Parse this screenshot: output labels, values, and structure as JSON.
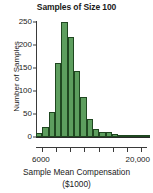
{
  "chart_data": {
    "type": "bar",
    "title": "Samples of Size 100",
    "xlabel": "Sample Mean Compensation",
    "xlabel_unit": "($1000)",
    "ylabel": "Number of Samples",
    "ylim": [
      0,
      250
    ],
    "yticks": [
      0,
      50,
      100,
      150,
      200,
      250
    ],
    "ytick_labels": [
      "0",
      "50",
      "100",
      "150",
      "200",
      "250"
    ],
    "xlim": [
      5000,
      21000
    ],
    "xtick_labels_shown": [
      "6000",
      "20,000"
    ],
    "xtick_count": 8,
    "grid": false,
    "legend": false,
    "bar_color": "#5d9e5e",
    "bar_edge_color": "#1f4720",
    "bin_width": 800,
    "categories": [
      "6000",
      "6800",
      "7600",
      "8400",
      "9200",
      "10000",
      "10800",
      "11600",
      "12400",
      "13200",
      "14000",
      "14800",
      "15600",
      "16400",
      "17200",
      "18000",
      "18800",
      "19600"
    ],
    "values": [
      8,
      22,
      55,
      160,
      250,
      217,
      143,
      88,
      40,
      18,
      11,
      11,
      6,
      2,
      1,
      1,
      0,
      1
    ]
  },
  "axes": {
    "ytick_marks": [
      0,
      50,
      100,
      150,
      200,
      250
    ]
  }
}
